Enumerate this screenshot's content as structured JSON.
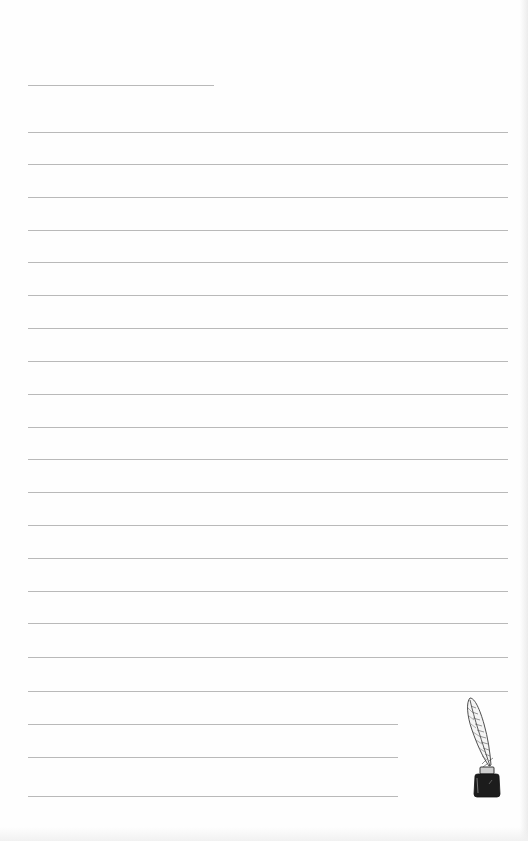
{
  "page": {
    "title_line": {
      "x": 28,
      "y": 85,
      "width": 186
    },
    "full_lines": {
      "x": 28,
      "width": 480,
      "ys": [
        132,
        164,
        197,
        230,
        262,
        295,
        328,
        361,
        394,
        427,
        459,
        492,
        525,
        558,
        591,
        623,
        657,
        691
      ]
    },
    "short_lines": {
      "x": 28,
      "width": 370,
      "ys": [
        724,
        757,
        796
      ]
    },
    "colors": {
      "paper": "#fefefe",
      "rule": "#b9b9b9",
      "ink": "#1a1a1a"
    },
    "decoration": "quill-and-inkwell"
  }
}
